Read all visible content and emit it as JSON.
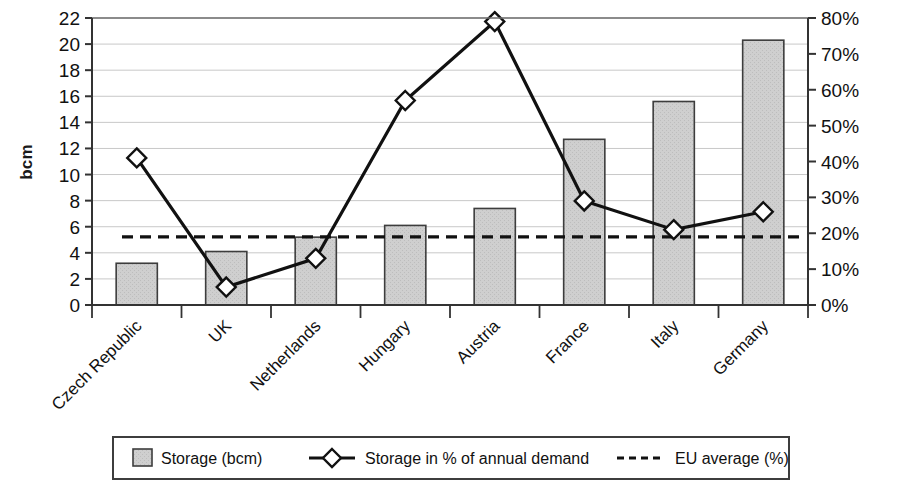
{
  "chart_data": {
    "type": "bar",
    "title": "",
    "subtitle": "",
    "xlabel": "",
    "ylabel": "bcm",
    "y2label": "",
    "ylim": [
      0,
      22
    ],
    "y2lim": [
      0,
      80
    ],
    "grid": true,
    "legend_position": "bottom",
    "categories": [
      "Czech Republic",
      "UK",
      "Netherlands",
      "Hungary",
      "Austria",
      "France",
      "Italy",
      "Germany"
    ],
    "series": [
      {
        "name": "Storage (bcm)",
        "type": "bar",
        "axis": "left",
        "unit": "bcm",
        "values": [
          3.2,
          4.1,
          5.2,
          6.1,
          7.4,
          12.7,
          15.6,
          20.3
        ]
      },
      {
        "name": "Storage in % of annual demand",
        "type": "line",
        "axis": "right",
        "unit": "%",
        "marker": "diamond",
        "values": [
          41,
          5,
          13,
          57,
          79,
          29,
          21,
          26
        ]
      },
      {
        "name": "EU average (%)",
        "type": "constant-line",
        "axis": "right",
        "unit": "%",
        "style": "dashed",
        "value": 19
      }
    ],
    "y_ticks": [
      0,
      2,
      4,
      6,
      8,
      10,
      12,
      14,
      16,
      18,
      20,
      22
    ],
    "y_tick_labels": [
      "0",
      "2",
      "4",
      "6",
      "8",
      "10",
      "12",
      "14",
      "16",
      "18",
      "20",
      "22"
    ],
    "y2_ticks": [
      0,
      10,
      20,
      30,
      40,
      50,
      60,
      70,
      80
    ],
    "y2_tick_labels": [
      "0%",
      "10%",
      "20%",
      "30%",
      "40%",
      "50%",
      "60%",
      "70%",
      "80%"
    ]
  },
  "legend": {
    "items": [
      {
        "label": "Storage (bcm)",
        "marker": "gray-square-swatch"
      },
      {
        "label": "Storage in % of annual demand",
        "marker": "line-diamond-marker"
      },
      {
        "label": "EU average (%)",
        "marker": "dashed-line-swatch"
      }
    ]
  },
  "colors": {
    "bar_fill": "#cfcfcf",
    "bar_stroke": "#3d3d3d",
    "line": "#111111",
    "marker_fill": "#ffffff",
    "marker_stroke": "#111111",
    "average_line": "#111111",
    "grid": "#c8c8c8",
    "axis": "#333333",
    "text": "#111111",
    "background": "#ffffff"
  }
}
